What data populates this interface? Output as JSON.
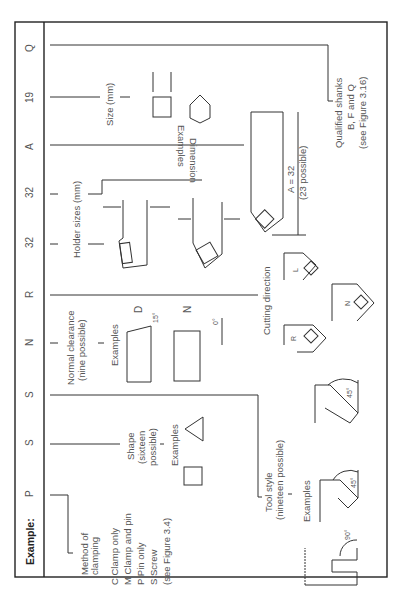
{
  "header": {
    "example_label": "Example:",
    "codes": [
      "P",
      "S",
      "S",
      "N",
      "R",
      "32",
      "32",
      "A",
      "19",
      "Q"
    ]
  },
  "clamping": {
    "title_line1": "Method of",
    "title_line2": "clamping",
    "options": [
      "C  Clamp only",
      "M  Clamp and pin",
      "P  Pin only",
      "S  Screw"
    ],
    "reference": "(see Figure 3.4)"
  },
  "shape": {
    "title_line1": "Shape",
    "title_line2": "(sixteen",
    "title_line3": "possible)",
    "examples_label": "Examples"
  },
  "tool_style": {
    "title_line1": "Tool style",
    "title_line2": "(nineteen possible)",
    "examples_label": "Examples",
    "angles": [
      "90°",
      "45°",
      "45°"
    ]
  },
  "clearance": {
    "title_line1": "Normal clearance",
    "title_line2": "(nine possible)",
    "examples_label": "Examples",
    "example_d_label": "D",
    "example_d_angle": "15°",
    "example_n_label": "N",
    "example_n_angle": "0°"
  },
  "cutting_direction": {
    "title": "Cutting direction",
    "labels": [
      "R",
      "N",
      "L"
    ]
  },
  "holder": {
    "title": "Holder sizes (mm)"
  },
  "length": {
    "value": "A = 32",
    "note": "(23 possible)"
  },
  "dimension": {
    "title_line1": "Dimension",
    "title_line2": "Examples",
    "size_label": "Size (mm)"
  },
  "qualified": {
    "line1": "Qualified shanks",
    "line2": "B, F and Q",
    "line3": "(see Figure 3.16)"
  }
}
